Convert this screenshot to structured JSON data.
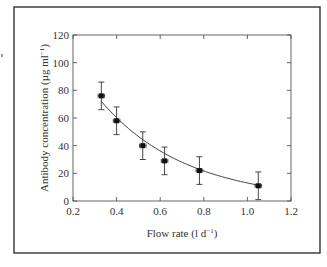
{
  "chart_data": {
    "type": "scatter",
    "title": "",
    "xlabel": "Flow rate (l d⁻¹)",
    "ylabel": "Antibody concentration (µg ml⁻¹)",
    "xlim": [
      0.2,
      1.2
    ],
    "ylim": [
      0,
      120
    ],
    "xticks": [
      "0.2",
      "0.4",
      "0.6",
      "0.8",
      "1.0",
      "1.2"
    ],
    "yticks": [
      "0",
      "20",
      "40",
      "60",
      "80",
      "100",
      "120"
    ],
    "grid": false,
    "legend": null,
    "series": [
      {
        "name": "Measured",
        "marker": "square",
        "x": [
          0.33,
          0.4,
          0.52,
          0.62,
          0.78,
          1.05
        ],
        "y": [
          76,
          58,
          40,
          29,
          22,
          11
        ],
        "y_err": [
          10,
          10,
          10,
          10,
          10,
          10
        ],
        "x_err": [
          0.015,
          0.015,
          0.015,
          0.015,
          0.015,
          0.015
        ]
      },
      {
        "name": "Fit",
        "type": "line",
        "x": [
          0.33,
          0.4,
          0.52,
          0.62,
          0.78,
          1.04
        ],
        "y": [
          72,
          58,
          41,
          32,
          21,
          10
        ]
      }
    ]
  },
  "labels": {
    "xlabel_main": "Flow rate (l d",
    "xlabel_sup": "−1",
    "xlabel_end": ")",
    "ylabel_main": "Antibody concentration (µg ml",
    "ylabel_sup": "−1",
    "ylabel_end": ")"
  }
}
